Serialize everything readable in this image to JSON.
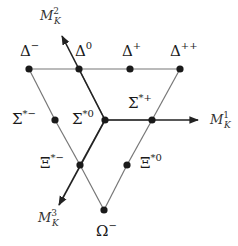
{
  "diagram": {
    "colors": {
      "line": "#777777",
      "axis": "#222222",
      "dot": "#1a1a1a",
      "text": "#1a1a1a"
    },
    "axes": [
      {
        "id": "M1",
        "label": "M",
        "sup": "1",
        "sub": "K",
        "from": [
          105,
          120
        ],
        "to": [
          198,
          120
        ],
        "label_pos": [
          210,
          124
        ]
      },
      {
        "id": "M2",
        "label": "M",
        "sup": "2",
        "sub": "K",
        "from": [
          105,
          120
        ],
        "to": [
          62,
          36
        ],
        "label_pos": [
          40,
          20
        ]
      },
      {
        "id": "M3",
        "label": "M",
        "sup": "3",
        "sub": "K",
        "from": [
          105,
          120
        ],
        "to": [
          59,
          205
        ],
        "label_pos": [
          38,
          222
        ]
      }
    ],
    "nodes": [
      {
        "id": "delta-minus",
        "base": "Δ",
        "sup": "−",
        "x": 29,
        "y": 69,
        "lx": 20,
        "ly": 56
      },
      {
        "id": "delta-zero",
        "base": "Δ",
        "sup": "0",
        "x": 79,
        "y": 69,
        "lx": 75,
        "ly": 56
      },
      {
        "id": "delta-plus",
        "base": "Δ",
        "sup": "+",
        "x": 130,
        "y": 69,
        "lx": 122,
        "ly": 56
      },
      {
        "id": "delta-plusplus",
        "base": "Δ",
        "sup": "++",
        "x": 180,
        "y": 69,
        "lx": 170,
        "ly": 56
      },
      {
        "id": "sigma-star-minus",
        "base": "Σ",
        "sup": "*−",
        "x": 55,
        "y": 120,
        "lx": 12,
        "ly": 124
      },
      {
        "id": "sigma-star-zero",
        "base": "Σ",
        "sup": "*0",
        "x": 105,
        "y": 120,
        "lx": 72,
        "ly": 124
      },
      {
        "id": "sigma-star-plus",
        "base": "Σ",
        "sup": "*+",
        "x": 152,
        "y": 120,
        "lx": 128,
        "ly": 108
      },
      {
        "id": "xi-star-minus",
        "base": "Ξ",
        "sup": "*−",
        "x": 80,
        "y": 165,
        "lx": 40,
        "ly": 168
      },
      {
        "id": "xi-star-zero",
        "base": "Ξ",
        "sup": "*0",
        "x": 127,
        "y": 165,
        "lx": 140,
        "ly": 168
      },
      {
        "id": "omega-minus",
        "base": "Ω",
        "sup": "−",
        "x": 104,
        "y": 210,
        "lx": 96,
        "ly": 236
      }
    ],
    "edges": [
      [
        "delta-minus",
        "delta-zero"
      ],
      [
        "delta-zero",
        "delta-plus"
      ],
      [
        "delta-plus",
        "delta-plusplus"
      ],
      [
        "delta-minus",
        "sigma-star-minus"
      ],
      [
        "sigma-star-minus",
        "xi-star-minus"
      ],
      [
        "xi-star-minus",
        "omega-minus"
      ],
      [
        "delta-plusplus",
        "sigma-star-plus"
      ],
      [
        "sigma-star-plus",
        "xi-star-zero"
      ],
      [
        "xi-star-zero",
        "omega-minus"
      ],
      [
        "delta-zero",
        "sigma-star-zero"
      ],
      [
        "sigma-star-zero",
        "sigma-star-plus"
      ],
      [
        "sigma-star-zero",
        "xi-star-minus"
      ]
    ]
  }
}
